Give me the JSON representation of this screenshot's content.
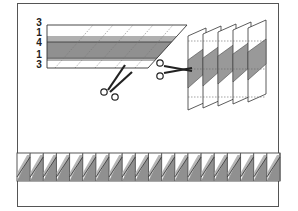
{
  "diagram": {
    "strip_widths": [
      "3",
      "1",
      "4",
      "1",
      "3"
    ],
    "colors": {
      "frame": "#555555",
      "light_fabric": "#ffffff",
      "medium_fabric": "#a8a8a8",
      "dark_fabric": "#8a8a8a",
      "outline": "#333333"
    },
    "steps": [
      {
        "name": "sew-strip-set",
        "description": "Strip set with widths 3-1-4-1-3, cut on diagonal"
      },
      {
        "name": "cut-parallelograms",
        "description": "Five stacked parallelogram segments, cut across middle"
      },
      {
        "name": "sawtooth-border",
        "description": "Row of triangle units forming sawtooth border"
      }
    ],
    "bottom_border": {
      "unit_count": 20
    }
  }
}
